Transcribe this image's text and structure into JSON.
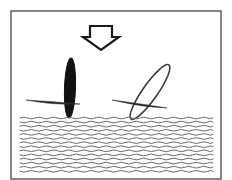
{
  "figure": {
    "alt_text": "Line drawing: a downward arrow above two elongated objects resting on a wavy water surface; the left object is vertical and filled black, the right object is tilted and outlined.",
    "canvas": {
      "width": 232,
      "height": 180,
      "background": "#ffffff"
    },
    "frame": {
      "label": "figure-border",
      "x": 11,
      "y": 11,
      "width": 210,
      "height": 168,
      "stroke": "#555555",
      "stroke_width": 1.4,
      "fill": "none"
    },
    "colors": {
      "ink": "#1a1a1a",
      "outline": "#3c3c3c",
      "water": "#6b6b6b",
      "fill_solid": "#111111",
      "fill_hollow": "#ffffff",
      "background": "#ffffff",
      "frame": "#555555"
    },
    "elements": [
      {
        "id": "force-arrow",
        "name": "downward-force-arrow",
        "type": "arrow",
        "direction": "down",
        "style": "hollow-outlined",
        "stroke": "#1a1a1a",
        "stroke_width": 2.2,
        "fill": "#ffffff",
        "shaft": {
          "x": 90,
          "y": 26,
          "width": 22,
          "height": 11
        },
        "head": {
          "tip_x": 101,
          "tip_y": 50,
          "half_width": 18,
          "top_y": 37
        }
      },
      {
        "id": "object-left",
        "name": "vertical-filled-object",
        "type": "ellipse",
        "state": "vertical",
        "fill": "#111111",
        "stroke": "#111111",
        "stroke_width": 1,
        "cx": 70,
        "cy": 88,
        "rx": 5.5,
        "ry": 30,
        "rotation_deg": 2
      },
      {
        "id": "object-left-needle",
        "name": "left-horizontal-needle",
        "type": "tapered-line",
        "stroke": "#2a2a2a",
        "start": {
          "x": 26,
          "y": 100
        },
        "end": {
          "x": 80,
          "y": 104
        },
        "max_thickness": 3.2
      },
      {
        "id": "object-right",
        "name": "tilted-hollow-object",
        "type": "ellipse",
        "state": "tilted",
        "fill": "#ffffff",
        "stroke": "#3c3c3c",
        "stroke_width": 1.6,
        "cx": 150,
        "cy": 92,
        "rx": 7.5,
        "ry": 33,
        "rotation_deg": 35
      },
      {
        "id": "object-right-needle",
        "name": "right-horizontal-needle",
        "type": "tapered-line",
        "stroke": "#2a2a2a",
        "start": {
          "x": 112,
          "y": 100
        },
        "end": {
          "x": 167,
          "y": 108
        },
        "max_thickness": 3.0
      },
      {
        "id": "water-body",
        "name": "wavy-water-surface",
        "type": "wave-field",
        "stroke": "#6b6b6b",
        "stroke_width": 1.0,
        "x_start": 20,
        "x_end": 213,
        "y_start": 118,
        "line_count": 14,
        "line_spacing": 4.1,
        "wave_amplitude": 1.7,
        "wave_period": 15
      }
    ]
  },
  "chart_data": {
    "type": "diagram",
    "annotations": [
      {
        "label": "applied downward force",
        "target": "force-arrow"
      },
      {
        "label": "object oriented vertically (solid)",
        "target": "object-left"
      },
      {
        "label": "object oriented at an angle (hollow)",
        "target": "object-right"
      },
      {
        "label": "liquid / water surface",
        "target": "water-body"
      }
    ],
    "legend": [],
    "xlabel": "",
    "ylabel": ""
  }
}
